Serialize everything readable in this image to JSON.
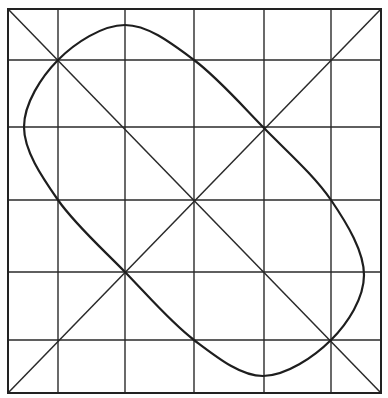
{
  "diagram": {
    "colors": {
      "background": "#ffffff",
      "line": "#2a2a2a",
      "curve": "#1e1e1e"
    },
    "border": {
      "x1": 8,
      "y1": 9,
      "x2": 381,
      "y2": 393
    },
    "vertical_lines_x": [
      58,
      125,
      194,
      264,
      331
    ],
    "horizontal_lines_y": [
      60,
      127,
      200,
      272,
      340
    ],
    "diagonals": [
      {
        "name": "main-diagonal",
        "from": [
          8,
          9
        ],
        "to": [
          381,
          393
        ]
      },
      {
        "name": "anti-diagonal",
        "from": [
          381,
          9
        ],
        "to": [
          8,
          393
        ]
      }
    ],
    "curve_points": [
      [
        58,
        60
      ],
      [
        125,
        25
      ],
      [
        194,
        60
      ],
      [
        264,
        128
      ],
      [
        331,
        200
      ],
      [
        364,
        275
      ],
      [
        331,
        340
      ],
      [
        263,
        376
      ],
      [
        194,
        340
      ],
      [
        125,
        272
      ],
      [
        58,
        200
      ],
      [
        24,
        127
      ]
    ]
  }
}
